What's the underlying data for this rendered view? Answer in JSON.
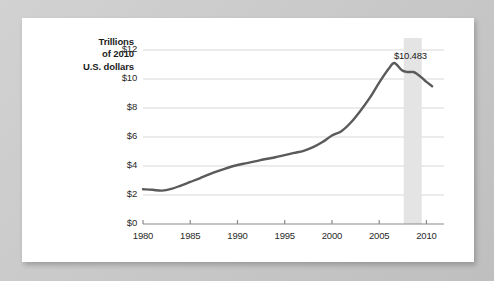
{
  "figure": {
    "axis_title_lines": [
      "Trillions",
      "of 2010",
      "U.S. dollars"
    ],
    "annotation_label": "$10.483"
  },
  "chart_data": {
    "type": "line",
    "title": "",
    "subtitle": "",
    "xlabel": "",
    "ylabel": "Trillions of 2010 U.S. dollars",
    "xlim": [
      1980,
      2010.8
    ],
    "ylim": [
      0,
      12
    ],
    "grid": "horizontal",
    "legend": "none",
    "x_ticks": [
      1980,
      1985,
      1990,
      1995,
      2000,
      2005,
      2010
    ],
    "x_tick_labels": [
      "1980",
      "1985",
      "1990",
      "1995",
      "2000",
      "2005",
      "2010"
    ],
    "y_ticks": [
      0,
      2,
      4,
      6,
      8,
      10,
      12
    ],
    "y_tick_labels": [
      "$0",
      "$2",
      "$4",
      "$6",
      "$8",
      "$10",
      "$12"
    ],
    "series": [
      {
        "name": "Value",
        "color": "#5a5a5a",
        "x": [
          1980,
          1981,
          1982,
          1983,
          1984,
          1985,
          1986,
          1987,
          1988,
          1989,
          1990,
          1991,
          1992,
          1993,
          1994,
          1995,
          1996,
          1997,
          1998,
          1999,
          2000,
          2001,
          2002,
          2003,
          2004,
          2005,
          2006,
          2006.6,
          2007.4,
          2008,
          2008.6,
          2009,
          2009.5,
          2010,
          2010.6
        ],
        "values": [
          2.4,
          2.36,
          2.3,
          2.42,
          2.65,
          2.9,
          3.15,
          3.42,
          3.66,
          3.88,
          4.07,
          4.2,
          4.34,
          4.48,
          4.6,
          4.75,
          4.9,
          5.05,
          5.3,
          5.65,
          6.1,
          6.4,
          7.0,
          7.8,
          8.7,
          9.75,
          10.7,
          11.1,
          10.6,
          10.483,
          10.483,
          10.35,
          10.1,
          9.8,
          9.5
        ]
      }
    ],
    "shaded_bands": [
      {
        "name": "recession",
        "x_start": 2007.6,
        "x_end": 2009.5,
        "color": "#e4e4e4"
      }
    ],
    "annotations": [
      {
        "text": "$10.483",
        "x": 2008.3,
        "y": 11.55
      }
    ]
  }
}
